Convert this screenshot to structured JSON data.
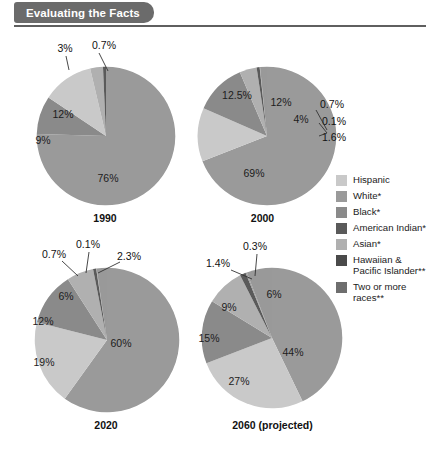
{
  "header": {
    "title": "Evaluating the Facts"
  },
  "legend": {
    "items": [
      {
        "label": "Hispanic",
        "color": "#c9c9c9"
      },
      {
        "label": "White*",
        "color": "#9a9a9a"
      },
      {
        "label": "Black*",
        "color": "#8a8a8a"
      },
      {
        "label": "American Indian*",
        "color": "#5a5a5a"
      },
      {
        "label": "Asian*",
        "color": "#b0b0b0"
      },
      {
        "label": "Hawaiian &\nPacific Islander**",
        "color": "#4a4a4a"
      },
      {
        "label": "Two or more\nraces**",
        "color": "#6e6e6e"
      }
    ]
  },
  "chart_data": [
    {
      "type": "pie",
      "title": "1990",
      "categories": [
        "White*",
        "Black*",
        "Hispanic",
        "Asian*",
        "American Indian*"
      ],
      "values": [
        76,
        9,
        12,
        3,
        0.7
      ],
      "labels": [
        "76%",
        "9%",
        "12%",
        "3%",
        "0.7%"
      ]
    },
    {
      "type": "pie",
      "title": "2000",
      "categories": [
        "White*",
        "Hispanic",
        "Black*",
        "Asian*",
        "American Indian*",
        "Hawaiian & Pacific Islander**",
        "Two or more races**"
      ],
      "values": [
        69,
        12.5,
        12,
        4,
        0.7,
        0.1,
        1.6
      ],
      "labels": [
        "69%",
        "12.5%",
        "12%",
        "4%",
        "0.7%",
        "0.1%",
        "1.6%"
      ]
    },
    {
      "type": "pie",
      "title": "2020",
      "categories": [
        "White*",
        "Hispanic",
        "Black*",
        "Asian*",
        "American Indian*",
        "Hawaiian & Pacific Islander**",
        "Two or more races**"
      ],
      "values": [
        60,
        19,
        12,
        6,
        0.7,
        0.1,
        2.3
      ],
      "labels": [
        "60%",
        "19%",
        "12%",
        "6%",
        "0.7%",
        "0.1%",
        "2.3%"
      ]
    },
    {
      "type": "pie",
      "title": "2060 (projected)",
      "categories": [
        "White*",
        "Hispanic",
        "Black*",
        "Asian*",
        "American Indian*",
        "Hawaiian & Pacific Islander**",
        "Two or more races**"
      ],
      "values": [
        44,
        27,
        15,
        9,
        1.4,
        0.3,
        6
      ],
      "labels": [
        "44%",
        "27%",
        "15%",
        "9%",
        "1.4%",
        "0.3%",
        "6%"
      ]
    }
  ]
}
